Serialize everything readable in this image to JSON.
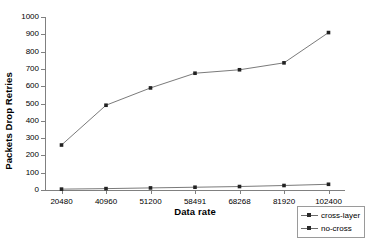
{
  "chart_data": {
    "type": "line",
    "title": "",
    "xlabel": "Data rate",
    "ylabel": "Packets Drop Retries",
    "categories": [
      "20480",
      "40960",
      "51200",
      "58491",
      "68268",
      "81920",
      "102400"
    ],
    "ylim": [
      0,
      1000
    ],
    "yticks": [
      "0",
      "100",
      "200",
      "300",
      "400",
      "500",
      "600",
      "700",
      "800",
      "900",
      "1000"
    ],
    "ytick_values": [
      0,
      100,
      200,
      300,
      400,
      500,
      600,
      700,
      800,
      900,
      1000
    ],
    "grid": false,
    "legend_position": "bottom-right",
    "series": [
      {
        "name": "cross-layer",
        "marker": "square",
        "color": "#6b6b6b",
        "values": [
          5,
          8,
          12,
          16,
          20,
          26,
          33
        ]
      },
      {
        "name": "no-cross",
        "marker": "square",
        "color": "#6b6b6b",
        "values": [
          260,
          490,
          590,
          675,
          695,
          735,
          910
        ]
      }
    ]
  },
  "legend": {
    "entries": [
      {
        "label": "cross-layer"
      },
      {
        "label": "no-cross"
      }
    ]
  },
  "axes": {
    "y_title": "Packets Drop Retries",
    "x_title": "Data rate"
  }
}
